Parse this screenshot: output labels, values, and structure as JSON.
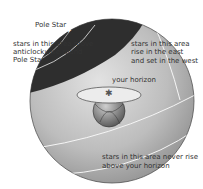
{
  "diagram": {
    "labels": {
      "pole_star": "Pole Star",
      "circumpolar_1": "stars in this area move",
      "circumpolar_2": "anticlockwise round",
      "circumpolar_3": "Pole Star",
      "rise_set_1": "stars in this area",
      "rise_set_2": "rise in the east",
      "rise_set_3": "and set in the west",
      "horizon": "your horizon",
      "never_rise_1": "stars in this area never rise",
      "never_rise_2": "above your horizon"
    },
    "colors": {
      "circumpolar_cap": "#2e2e2e",
      "sphere_light": "#d4d4d4",
      "sphere_mid": "#b0b0b0",
      "sphere_dark": "#8a8a8a",
      "horizon_disc": "#ececec",
      "orbit_lines": "#f5f5f5"
    }
  }
}
